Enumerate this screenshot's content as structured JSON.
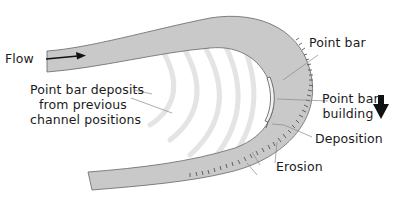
{
  "diagram": {
    "colors": {
      "channel_fill": "#c9c9c9",
      "channel_edge": "#555555",
      "old_bars": "#e6e6e6",
      "text": "#1a1a1a",
      "leader": "#888888"
    },
    "labels": {
      "flow": "Flow",
      "point_bar_deposits_line1": "Point bar deposits",
      "point_bar_deposits_line2": "from previous",
      "point_bar_deposits_line3": "channel positions",
      "point_bar": "Point bar",
      "point_bar_building_line1": "Point bar",
      "point_bar_building_line2": "building",
      "deposition": "Deposition",
      "erosion": "Erosion"
    },
    "icons": {
      "flow_arrow": "arrow-right",
      "migration_arrow": "arrow-down-bold"
    }
  }
}
